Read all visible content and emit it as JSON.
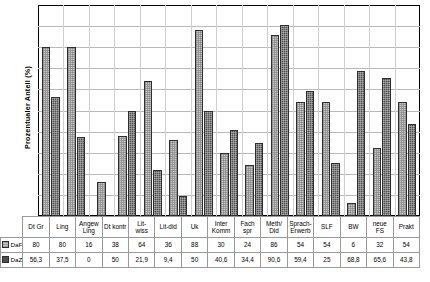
{
  "chart_data": {
    "type": "bar",
    "title": "",
    "xlabel": "",
    "ylabel": "Prozentualer Anteil (%)",
    "ylim": [
      0,
      100
    ],
    "ytick_step": 10,
    "yticks": [
      0,
      10,
      20,
      30,
      40,
      50,
      60,
      70,
      80,
      90,
      100
    ],
    "grid": true,
    "legend_position": "table-row-headers",
    "categories": [
      "Dt Gr",
      "Ling",
      "Angew Ling",
      "Dt kontr",
      "Lit-wiss",
      "Lit-did",
      "Uk",
      "Inter Komm",
      "Fach spr",
      "Meth/ Did",
      "Sprach- Erwerb",
      "SLF",
      "BW",
      "neue FS",
      "Prakt"
    ],
    "category_lines": [
      [
        "Dt Gr"
      ],
      [
        "Ling"
      ],
      [
        "Angew",
        "Ling"
      ],
      [
        "Dt kontr"
      ],
      [
        "Lit-",
        "wiss"
      ],
      [
        "Lit-did"
      ],
      [
        "Uk"
      ],
      [
        "Inter",
        "Komm"
      ],
      [
        "Fach",
        "spr"
      ],
      [
        "Meth/",
        "Did"
      ],
      [
        "Sprach-",
        "Erwerb"
      ],
      [
        "SLF"
      ],
      [
        "BW"
      ],
      [
        "neue",
        "FS"
      ],
      [
        "Prakt"
      ]
    ],
    "series": [
      {
        "name": "DaF (n=50)",
        "color": "#c9c9c9",
        "values": [
          80,
          80,
          16,
          38,
          64,
          36,
          88,
          30,
          24,
          86,
          54,
          54,
          6,
          32,
          54
        ],
        "labels": [
          "80",
          "80",
          "16",
          "38",
          "64",
          "36",
          "88",
          "30",
          "24",
          "86",
          "54",
          "54",
          "6",
          "32",
          "54"
        ]
      },
      {
        "name": "DaZ (n=32)",
        "color": "#4f4f4f",
        "values": [
          56.3,
          37.5,
          0,
          50,
          21.9,
          9.4,
          50,
          40.6,
          34.4,
          90.6,
          59.4,
          25,
          68.8,
          65.6,
          43.8
        ],
        "labels": [
          "56,3",
          "37,5",
          "0",
          "50",
          "21,9",
          "9,4",
          "50",
          "40,6",
          "34,4",
          "90,6",
          "59,4",
          "25",
          "68,8",
          "65,6",
          "43,8"
        ]
      }
    ]
  }
}
